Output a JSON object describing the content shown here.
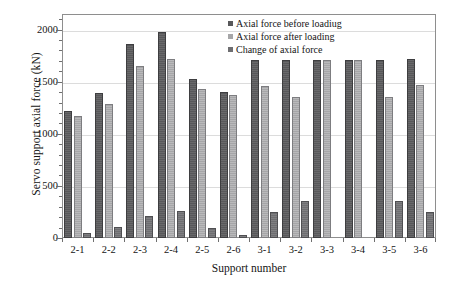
{
  "chart_data": {
    "type": "bar",
    "title": "",
    "xlabel": "Support number",
    "ylabel": "Servo support axial force (kN)",
    "categories": [
      "2-1",
      "2-2",
      "2-3",
      "2-4",
      "2-5",
      "2-6",
      "3-1",
      "3-2",
      "3-3",
      "3-4",
      "3-5",
      "3-6"
    ],
    "series": [
      {
        "name": "Axial force before loadiug",
        "color": "#58585a",
        "values": [
          1218,
          1390,
          1865,
          1980,
          1530,
          1400,
          1712,
          1712,
          1712,
          1712,
          1712,
          1715
        ]
      },
      {
        "name": "Axial force after loading",
        "color": "#a6a6a8",
        "values": [
          1172,
          1288,
          1655,
          1722,
          1435,
          1368,
          1462,
          1355,
          1712,
          1712,
          1358,
          1468
        ]
      },
      {
        "name": "Change of axial force",
        "color": "#6e6e71",
        "values": [
          46,
          102,
          210,
          258,
          95,
          32,
          250,
          357,
          0,
          0,
          354,
          247
        ]
      }
    ],
    "ylim": [
      0,
      2150
    ],
    "yticks": [
      0,
      500,
      1000,
      1500,
      2000
    ],
    "ytick_labels": [
      "0",
      "500",
      "1000",
      "1500",
      "2000"
    ],
    "y_minor_tick_step": 100,
    "grid": true,
    "grid_axis": "y",
    "legend_position": "top-center-right"
  },
  "axis": {
    "y_title": "Servo support axial force (kN)",
    "x_title": "Support number"
  },
  "legend": {
    "items": [
      {
        "label": "Axial force before loadiug"
      },
      {
        "label": "Axial force after loading"
      },
      {
        "label": "Change of axial force"
      }
    ]
  }
}
